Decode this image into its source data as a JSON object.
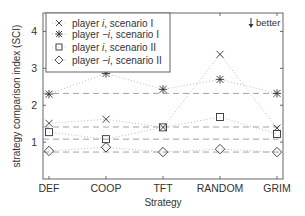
{
  "chart_data": {
    "type": "line",
    "title": "",
    "xlabel": "Strategy",
    "ylabel": "strategy comparison index (SCI)",
    "categories": [
      "DEF",
      "COOP",
      "TFT",
      "RANDOM",
      "GRIM"
    ],
    "ylim": [
      0,
      4.5
    ],
    "yticks": [
      1,
      2,
      3,
      4
    ],
    "grid": false,
    "legend_position": "upper left",
    "annotation": "better",
    "annotation_arrow": "down",
    "series": [
      {
        "name": "player i, scenario I",
        "label_parts": [
          "player ",
          "i",
          ", scenario I"
        ],
        "marker": "x",
        "values": [
          1.51,
          1.62,
          1.4,
          3.38,
          1.38
        ],
        "reference": 1.41
      },
      {
        "name": "player -i, scenario I",
        "label_parts": [
          "player ",
          "−i",
          ", scenario I"
        ],
        "marker": "star",
        "values": [
          2.3,
          2.86,
          2.43,
          2.7,
          2.32
        ],
        "reference": 2.32
      },
      {
        "name": "player i, scenario II",
        "label_parts": [
          "player ",
          "i",
          ", scenario II"
        ],
        "marker": "square",
        "values": [
          1.27,
          1.08,
          1.4,
          1.68,
          1.22
        ],
        "reference": 1.08
      },
      {
        "name": "player -i, scenario II",
        "label_parts": [
          "player ",
          "−i",
          ", scenario II"
        ],
        "marker": "diamond",
        "values": [
          0.76,
          0.86,
          0.73,
          0.81,
          0.73
        ],
        "reference": 0.73
      }
    ],
    "reference_lines": [
      2.32,
      1.41,
      1.08,
      0.73
    ],
    "colors": {
      "axis": "#666666",
      "marker": "#333333",
      "series_line": "#bbbbbb",
      "reference_line": "#999999",
      "text": "#333333"
    }
  }
}
